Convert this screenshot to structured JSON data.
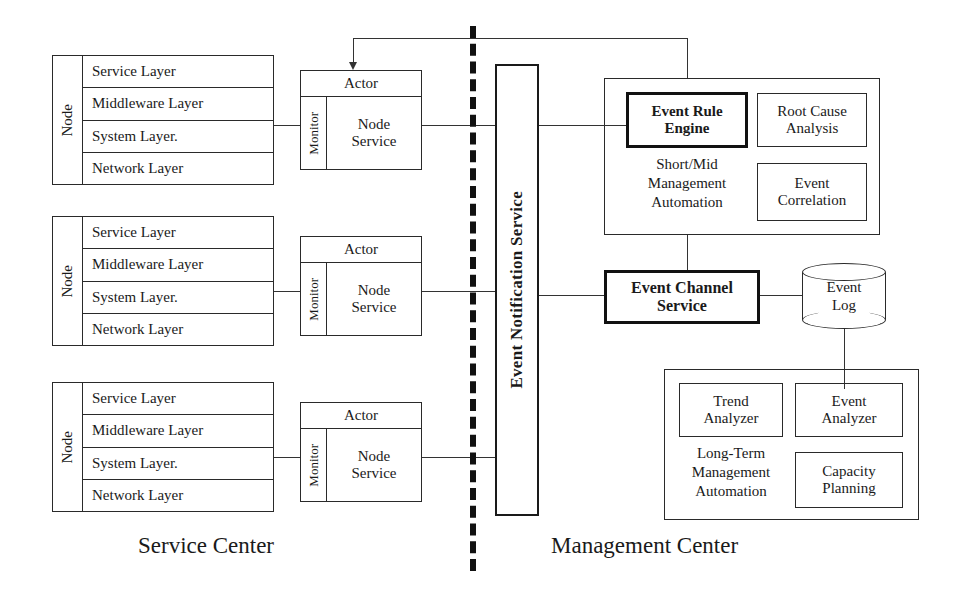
{
  "diagram": {
    "captions": {
      "left": "Service Center",
      "right": "Management Center"
    },
    "node_label": "Node",
    "node_layers": [
      "Service Layer",
      "Middleware Layer",
      "System Layer.",
      "Network Layer"
    ],
    "actor": {
      "header": "Actor",
      "monitor": "Monitor",
      "service": "Node\nService",
      "service_line1": "Node",
      "service_line2": "Service"
    },
    "nodes": [
      {
        "label": "Node",
        "layers": [
          "Service Layer",
          "Middleware Layer",
          "System Layer.",
          "Network Layer"
        ]
      },
      {
        "label": "Node",
        "layers": [
          "Service Layer",
          "Middleware Layer",
          "System Layer.",
          "Network Layer"
        ]
      },
      {
        "label": "Node",
        "layers": [
          "Service Layer",
          "Middleware Layer",
          "System Layer.",
          "Network Layer"
        ]
      }
    ],
    "event_notification_service": "Event Notification Service",
    "short_mid": {
      "automation_label": "Short/Mid\nManagement\nAutomation",
      "automation_line1": "Short/Mid",
      "automation_line2": "Management",
      "automation_line3": "Automation",
      "event_rule_engine_line1": "Event Rule",
      "event_rule_engine_line2": "Engine",
      "root_cause_line1": "Root Cause",
      "root_cause_line2": "Analysis",
      "event_correlation_line1": "Event",
      "event_correlation_line2": "Correlation"
    },
    "event_channel_service_line1": "Event Channel",
    "event_channel_service_line2": "Service",
    "event_log_line1": "Event",
    "event_log_line2": "Log",
    "long_term": {
      "automation_line1": "Long-Term",
      "automation_line2": "Management",
      "automation_line3": "Automation",
      "trend_analyzer_line1": "Trend",
      "trend_analyzer_line2": "Analyzer",
      "event_analyzer_line1": "Event",
      "event_analyzer_line2": "Analyzer",
      "capacity_planning_line1": "Capacity",
      "capacity_planning_line2": "Planning"
    },
    "colors": {
      "line": "#333333",
      "border": "#2a2a2a",
      "emphasis_border": "#111111",
      "background": "#ffffff"
    }
  }
}
